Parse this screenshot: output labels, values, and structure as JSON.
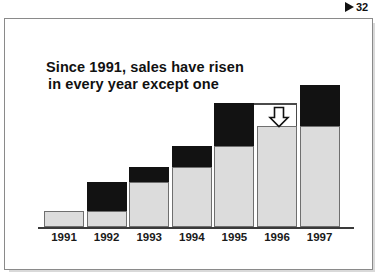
{
  "top_marker": {
    "icon": "triangle-right-marker",
    "text": "32"
  },
  "slide": {
    "title_line1": "Since 1991, sales have risen",
    "title_line2": "in every year except one"
  },
  "annotation": {
    "arrow_icon": "arrow-down-hollow",
    "reference_line": "prior-peak-level-1995"
  },
  "colors": {
    "bar_base": "#dcdcdc",
    "bar_increment": "#121212",
    "bar_outline": "#6f6f6f",
    "axis": "#3a3a3a",
    "frame": "#8a8a8a",
    "text": "#111111"
  },
  "chart_data": {
    "type": "bar",
    "title": "Since 1991, sales have risen in every year except one",
    "xlabel": "",
    "ylabel": "",
    "categories": [
      "1991",
      "1992",
      "1993",
      "1994",
      "1995",
      "1996",
      "1997"
    ],
    "series": [
      {
        "name": "Prior year level",
        "values": [
          16,
          16,
          45,
          60,
          81,
          101,
          101
        ]
      },
      {
        "name": "Change in year",
        "values": [
          0,
          29,
          15,
          21,
          43,
          0,
          41
        ]
      }
    ],
    "totals": [
      16,
      45,
      60,
      81,
      124,
      101,
      142
    ],
    "ylim": [
      0,
      152
    ],
    "grid": false,
    "legend": "none",
    "annotations": [
      {
        "type": "arrow-down",
        "target_category": "1996",
        "note": "sales declined in 1996"
      },
      {
        "type": "reference-line",
        "from_category": "1995",
        "to_category": "1996",
        "value": 124
      }
    ]
  }
}
